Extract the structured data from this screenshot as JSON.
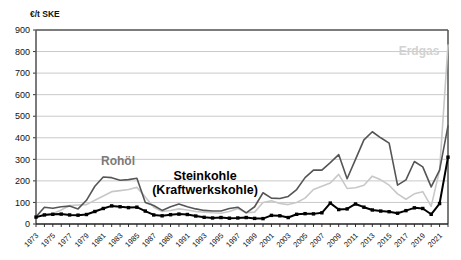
{
  "chart": {
    "unit_label": "€/t SKE",
    "y_axis": {
      "min": 0,
      "max": 900,
      "step": 100,
      "ticks": [
        "0",
        "100",
        "200",
        "300",
        "400",
        "500",
        "600",
        "700",
        "800",
        "900"
      ]
    },
    "x_axis": {
      "min": 1973,
      "max": 2022,
      "label_step": 2,
      "tick_step": 1,
      "ticks": [
        "1973",
        "1975",
        "1977",
        "1979",
        "1981",
        "1983",
        "1985",
        "1987",
        "1989",
        "1991",
        "1993",
        "1995",
        "1997",
        "1999",
        "2001",
        "2003",
        "2005",
        "2007",
        "2009",
        "2011",
        "2013",
        "2015",
        "2017",
        "2019",
        "2021"
      ]
    },
    "annotations": [
      {
        "name": "rohoel",
        "text": "Rohöl",
        "color": "#7a7a7a"
      },
      {
        "name": "steinkohle",
        "text": "Steinkohle",
        "color": "#000000"
      },
      {
        "name": "steinkohle-sub",
        "text": "(Kraftwerkskohle)",
        "color": "#000000"
      },
      {
        "name": "erdgas",
        "text": "Erdgas",
        "color": "#d2d2d2"
      }
    ],
    "colors": {
      "rohoel": "#555555",
      "steinkohle": "#000000",
      "erdgas": "#c8c8c8",
      "grid": "#c9c9c9",
      "frame": "#5a5a5a",
      "background": "#ffffff"
    }
  },
  "chart_data": {
    "type": "line",
    "title": "",
    "xlabel": "",
    "ylabel": "€/t SKE",
    "ylim": [
      0,
      900
    ],
    "xlim": [
      1973,
      2022
    ],
    "grid": true,
    "legend": "inline-annotations",
    "x": [
      1973,
      1974,
      1975,
      1976,
      1977,
      1978,
      1979,
      1980,
      1981,
      1982,
      1983,
      1984,
      1985,
      1986,
      1987,
      1988,
      1989,
      1990,
      1991,
      1992,
      1993,
      1994,
      1995,
      1996,
      1997,
      1998,
      1999,
      2000,
      2001,
      2002,
      2003,
      2004,
      2005,
      2006,
      2007,
      2008,
      2009,
      2010,
      2011,
      2012,
      2013,
      2014,
      2015,
      2016,
      2017,
      2018,
      2019,
      2020,
      2021,
      2022
    ],
    "series": [
      {
        "name": "Rohöl",
        "color": "#555555",
        "marker": "none",
        "values": [
          33,
          78,
          73,
          80,
          83,
          70,
          110,
          175,
          218,
          215,
          203,
          206,
          212,
          100,
          86,
          63,
          80,
          93,
          80,
          70,
          63,
          60,
          60,
          72,
          78,
          52,
          80,
          145,
          120,
          118,
          128,
          160,
          215,
          250,
          250,
          285,
          322,
          210,
          300,
          390,
          428,
          400,
          375,
          180,
          205,
          290,
          265,
          172,
          250,
          455
        ]
      },
      {
        "name": "Erdgas",
        "color": "#c8c8c8",
        "marker": "none",
        "values": [
          30,
          46,
          48,
          65,
          86,
          88,
          90,
          110,
          130,
          150,
          155,
          160,
          170,
          125,
          78,
          58,
          63,
          70,
          65,
          58,
          55,
          52,
          50,
          58,
          72,
          52,
          55,
          100,
          108,
          95,
          90,
          100,
          120,
          160,
          175,
          190,
          230,
          165,
          168,
          180,
          222,
          205,
          180,
          140,
          115,
          140,
          150,
          82,
          250,
          830
        ]
      },
      {
        "name": "Steinkohle (Kraftwerkskohle)",
        "color": "#000000",
        "marker": "square",
        "values": [
          32,
          42,
          45,
          46,
          42,
          41,
          44,
          58,
          72,
          84,
          80,
          76,
          78,
          60,
          42,
          38,
          43,
          46,
          44,
          37,
          31,
          28,
          30,
          27,
          28,
          30,
          26,
          25,
          40,
          38,
          30,
          45,
          48,
          47,
          52,
          97,
          67,
          70,
          93,
          78,
          65,
          60,
          57,
          50,
          62,
          75,
          72,
          45,
          95,
          310
        ]
      }
    ]
  }
}
